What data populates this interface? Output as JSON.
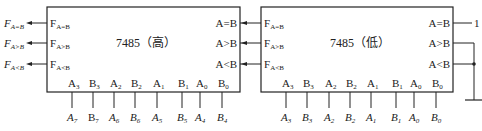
{
  "chips": [
    {
      "id": "high",
      "title": "7485（高）",
      "outputs": [
        {
          "label": "F",
          "sub": "A=B",
          "ext": "F",
          "ext_sub": "A=B"
        },
        {
          "label": "F",
          "sub": "A>B",
          "ext": "F",
          "ext_sub": "A>B"
        },
        {
          "label": "F",
          "sub": "A<B",
          "ext": "F",
          "ext_sub": "A<B"
        }
      ],
      "cascade_inputs": [
        "A=B",
        "A>B",
        "A<B"
      ],
      "pins": [
        {
          "in": "A",
          "in_sub": "3",
          "out": "A",
          "out_sub": "7",
          "out_italic": true
        },
        {
          "in": "B",
          "in_sub": "3",
          "out": "B",
          "out_sub": "7",
          "out_italic": false
        },
        {
          "in": "A",
          "in_sub": "2",
          "out": "A",
          "out_sub": "6",
          "out_italic": true
        },
        {
          "in": "B",
          "in_sub": "2",
          "out": "B",
          "out_sub": "6",
          "out_italic": true
        },
        {
          "in": "A",
          "in_sub": "1",
          "out": "A",
          "out_sub": "5",
          "out_italic": true
        },
        {
          "in": "B",
          "in_sub": "1",
          "out": "B",
          "out_sub": "5",
          "out_italic": true
        },
        {
          "in": "A",
          "in_sub": "0",
          "out": "A",
          "out_sub": "4",
          "out_italic": true
        },
        {
          "in": "B",
          "in_sub": "0",
          "out": "B",
          "out_sub": "4",
          "out_italic": true
        }
      ]
    },
    {
      "id": "low",
      "title": "7485（低）",
      "outputs": [
        {
          "label": "F",
          "sub": "A=B"
        },
        {
          "label": "F",
          "sub": "A>B"
        },
        {
          "label": "F",
          "sub": "A<B"
        }
      ],
      "cascade_inputs": [
        "A=B",
        "A>B",
        "A<B"
      ],
      "pins": [
        {
          "in": "A",
          "in_sub": "3",
          "out": "A",
          "out_sub": "3",
          "out_italic": true
        },
        {
          "in": "B",
          "in_sub": "3",
          "out": "B",
          "out_sub": "3",
          "out_italic": true
        },
        {
          "in": "A",
          "in_sub": "2",
          "out": "A",
          "out_sub": "2",
          "out_italic": true
        },
        {
          "in": "B",
          "in_sub": "2",
          "out": "B",
          "out_sub": "2",
          "out_italic": true
        },
        {
          "in": "A",
          "in_sub": "1",
          "out": "A",
          "out_sub": "1",
          "out_italic": true
        },
        {
          "in": "B",
          "in_sub": "1",
          "out": "B",
          "out_sub": "1",
          "out_italic": true
        },
        {
          "in": "A",
          "in_sub": "0",
          "out": "A",
          "out_sub": "0",
          "out_italic": true
        },
        {
          "in": "B",
          "in_sub": "0",
          "out": "B",
          "out_sub": "0",
          "out_italic": true
        }
      ]
    }
  ],
  "tie_high_value": "1",
  "colors": {
    "line": "#222222",
    "background": "#ffffff"
  }
}
